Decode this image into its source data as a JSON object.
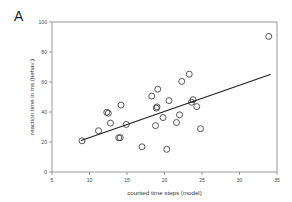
{
  "figure": {
    "panel_label": "A",
    "background_color": "#ffffff",
    "axis_color": "#8c8c8c",
    "marker_color": "#3a3a3a",
    "line_color": "#1f1f1f"
  },
  "chart_data": {
    "type": "scatter",
    "title": "",
    "xlabel": "counted time steps (model)",
    "ylabel": "reaction time in ms (behav.)",
    "xlim": [
      5,
      35
    ],
    "ylim": [
      0,
      100
    ],
    "xticks": [
      5,
      10,
      15,
      20,
      25,
      30,
      35
    ],
    "xticklabels": [
      "5",
      "10",
      "15",
      "20",
      "25",
      "30",
      "35"
    ],
    "yticks": [
      0,
      20,
      40,
      60,
      80,
      100
    ],
    "yticklabels": [
      "0",
      "20",
      "40",
      "60",
      "80",
      "100"
    ],
    "grid": false,
    "legend": null,
    "marker": "open-circle",
    "points": [
      {
        "x": 9.0,
        "y": 20.8
      },
      {
        "x": 11.2,
        "y": 27.5
      },
      {
        "x": 12.3,
        "y": 39.8
      },
      {
        "x": 12.5,
        "y": 39.2
      },
      {
        "x": 12.8,
        "y": 32.6
      },
      {
        "x": 13.9,
        "y": 22.8
      },
      {
        "x": 14.1,
        "y": 22.9
      },
      {
        "x": 14.2,
        "y": 44.6
      },
      {
        "x": 14.9,
        "y": 31.7
      },
      {
        "x": 17.0,
        "y": 16.8
      },
      {
        "x": 18.3,
        "y": 50.6
      },
      {
        "x": 18.8,
        "y": 30.9
      },
      {
        "x": 18.9,
        "y": 42.6
      },
      {
        "x": 19.0,
        "y": 43.4
      },
      {
        "x": 19.1,
        "y": 55.2
      },
      {
        "x": 19.8,
        "y": 36.3
      },
      {
        "x": 20.3,
        "y": 15.1
      },
      {
        "x": 20.6,
        "y": 47.6
      },
      {
        "x": 21.6,
        "y": 33.0
      },
      {
        "x": 22.0,
        "y": 38.1
      },
      {
        "x": 22.3,
        "y": 60.4
      },
      {
        "x": 23.3,
        "y": 65.2
      },
      {
        "x": 23.6,
        "y": 46.5
      },
      {
        "x": 23.8,
        "y": 48.2
      },
      {
        "x": 24.3,
        "y": 43.6
      },
      {
        "x": 24.8,
        "y": 28.9
      },
      {
        "x": 33.9,
        "y": 90.4
      }
    ],
    "fit_line": {
      "type": "linear-regression",
      "x_start": 8.9,
      "y_start": 21.0,
      "x_end": 34.1,
      "y_end": 65.0
    }
  }
}
